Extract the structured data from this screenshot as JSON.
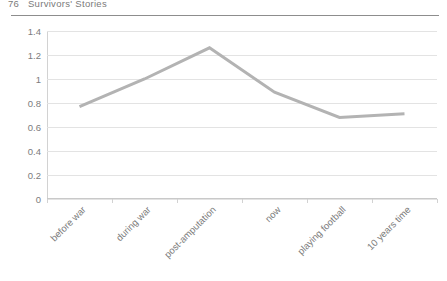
{
  "header": {
    "folio": "76",
    "running_title": "Survivors' Stories"
  },
  "chart_data": {
    "type": "line",
    "title": "",
    "xlabel": "",
    "ylabel": "",
    "categories": [
      "before war",
      "during war",
      "post-amputation",
      "now",
      "playing football",
      "10 years time"
    ],
    "values": [
      0.77,
      1.0,
      1.26,
      0.89,
      0.68,
      0.71
    ],
    "ylim": [
      0,
      1.4
    ],
    "y_ticks": [
      0,
      0.2,
      0.4,
      0.6,
      0.8,
      1,
      1.2,
      1.4
    ],
    "y_tick_labels": [
      "0",
      "0.2",
      "0.4",
      "0.6",
      "0.8",
      "1",
      "1.2",
      "1.4"
    ],
    "grid": true,
    "legend": false,
    "legend_position": "none",
    "series_color": "#b3b3b3",
    "grid_color": "#e3e3e3",
    "axis_color": "#d2d2d2",
    "markers": false,
    "line_width": 3
  }
}
